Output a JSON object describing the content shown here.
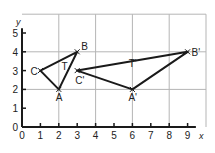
{
  "diagram": {
    "type": "coordinate-grid-translation",
    "x_axis": {
      "label": "x",
      "min": 0,
      "max": 9,
      "ticks": [
        "0",
        "1",
        "2",
        "3",
        "4",
        "5",
        "6",
        "7",
        "8",
        "9"
      ]
    },
    "y_axis": {
      "label": "y",
      "min": 0,
      "max": 5,
      "ticks": [
        "0",
        "1",
        "2",
        "3",
        "4",
        "5"
      ]
    },
    "grid": {
      "x_step": 2,
      "y_step": 2,
      "x_max": 10,
      "y_max": 6
    },
    "triangles": [
      {
        "name": "T",
        "label_pos": [
          2.15,
          3.05
        ],
        "vertices": [
          {
            "label": "A",
            "x": 2,
            "y": 2,
            "label_dx": -3,
            "label_dy": 12
          },
          {
            "label": "B",
            "x": 3,
            "y": 4,
            "label_dx": 4,
            "label_dy": -2
          },
          {
            "label": "C",
            "x": 1,
            "y": 3,
            "label_dx": -10,
            "label_dy": 4
          }
        ]
      },
      {
        "name": "T'",
        "label_pos": [
          5.8,
          3.2
        ],
        "vertices": [
          {
            "label": "A'",
            "x": 6,
            "y": 2,
            "label_dx": -4,
            "label_dy": 12
          },
          {
            "label": "B'",
            "x": 9,
            "y": 4,
            "label_dx": 4,
            "label_dy": 4
          },
          {
            "label": "C'",
            "x": 3,
            "y": 3,
            "label_dx": -2,
            "label_dy": 13
          }
        ]
      }
    ],
    "colors": {
      "line": "#1a1a1a",
      "grid": "#b5b5b5",
      "text": "#222222"
    }
  }
}
